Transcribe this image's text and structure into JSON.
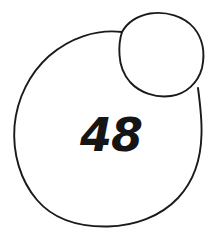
{
  "figure": {
    "background_color": "#ffffff",
    "stroke_color": "#1a1a1a",
    "label_color": "#151515",
    "label_text": "48",
    "shapes": [
      {
        "name": "large-circle",
        "type": "circle",
        "cx": 108,
        "cy": 129,
        "rx": 94,
        "ry": 98
      },
      {
        "name": "small-circle",
        "type": "circle",
        "cx": 161,
        "cy": 54,
        "rx": 42,
        "ry": 41
      }
    ],
    "label_position": {
      "x": 111,
      "y": 151
    }
  }
}
